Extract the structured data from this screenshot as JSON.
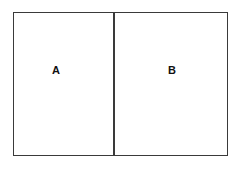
{
  "diagram": {
    "type": "two-region-partition",
    "regions": [
      {
        "label": "A"
      },
      {
        "label": "B"
      }
    ],
    "colors": {
      "stroke": "#3a3a3a",
      "background": "#ffffff",
      "text": "#111111"
    }
  }
}
